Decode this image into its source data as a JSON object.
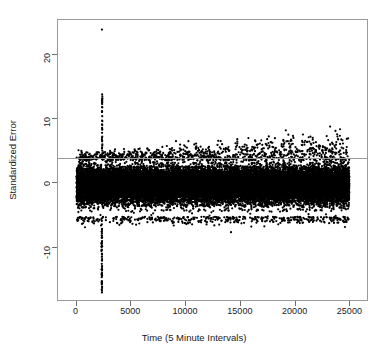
{
  "chart_data": {
    "type": "scatter",
    "title": "",
    "xlabel": "Time (5 Minute Intervals)",
    "ylabel": "Standardized Error",
    "xlim": [
      -1700,
      26700
    ],
    "ylim": [
      -18.5,
      25.5
    ],
    "grid": false,
    "legend": null,
    "point_color": "#000000",
    "point_style": "filled-circle",
    "point_size_px": 2.2,
    "axis_color": "#6e6e6e",
    "box_color": "#9a9a9a",
    "xticks": [
      0,
      5000,
      10000,
      15000,
      20000,
      25000
    ],
    "xtick_labels": [
      "0",
      "5000",
      "10000",
      "15000",
      "20000",
      "25000"
    ],
    "yticks": [
      -10,
      0,
      10,
      20
    ],
    "ytick_labels": [
      "-10",
      "0",
      "10",
      "20"
    ],
    "annotations": [
      {
        "name": "threshold-line",
        "type": "hline",
        "y": 4.0,
        "color": "#9a9a9a",
        "width_px": 1
      }
    ],
    "series": [
      {
        "name": "standardized-error",
        "description": "Dense band of standardized residuals across 5-minute interval time index, with a large transient spike near t=2300.",
        "n_points": 24500,
        "x_start": 0,
        "x_end": 24900,
        "band_center": -0.3,
        "band_sd": 1.35,
        "band_upper_edge": 3.6,
        "band_lower_edge": -5.2,
        "outliers": [
          {
            "x": 2310,
            "y": 24.0
          },
          {
            "x": 2330,
            "y": 13.9
          },
          {
            "x": 2330,
            "y": 12.6
          },
          {
            "x": 2335,
            "y": 11.9
          },
          {
            "x": 2325,
            "y": 11.2
          },
          {
            "x": 2340,
            "y": 10.5
          },
          {
            "x": 2330,
            "y": 9.8
          },
          {
            "x": 2345,
            "y": 9.1
          },
          {
            "x": 2335,
            "y": 8.5
          },
          {
            "x": 2325,
            "y": 7.9
          },
          {
            "x": 2340,
            "y": 7.3
          },
          {
            "x": 2330,
            "y": 6.7
          },
          {
            "x": 2350,
            "y": 6.1
          },
          {
            "x": 2320,
            "y": 5.6
          },
          {
            "x": 2345,
            "y": 5.1
          },
          {
            "x": 2335,
            "y": 4.7
          },
          {
            "x": 2355,
            "y": 4.3
          },
          {
            "x": 2300,
            "y": -6.4
          },
          {
            "x": 2320,
            "y": -7.1
          },
          {
            "x": 2310,
            "y": -7.8
          },
          {
            "x": 2330,
            "y": -8.4
          },
          {
            "x": 2315,
            "y": -9.1
          },
          {
            "x": 2325,
            "y": -9.8
          },
          {
            "x": 2310,
            "y": -11.4
          },
          {
            "x": 2325,
            "y": -12.9
          },
          {
            "x": 2315,
            "y": -13.6
          },
          {
            "x": 2330,
            "y": -14.4
          },
          {
            "x": 2320,
            "y": -15.6
          },
          {
            "x": 2325,
            "y": -16.3
          },
          {
            "x": 2315,
            "y": -17.0
          },
          {
            "x": 3100,
            "y": 4.9
          },
          {
            "x": 3450,
            "y": 4.4
          },
          {
            "x": 4200,
            "y": 4.2
          },
          {
            "x": 5100,
            "y": -6.3
          },
          {
            "x": 9900,
            "y": -6.2
          },
          {
            "x": 12400,
            "y": -6.0
          },
          {
            "x": 14100,
            "y": -7.6
          },
          {
            "x": 15100,
            "y": 5.1
          },
          {
            "x": 16200,
            "y": 4.6
          },
          {
            "x": 16900,
            "y": 5.3
          },
          {
            "x": 17400,
            "y": 6.9
          },
          {
            "x": 17600,
            "y": 5.9
          },
          {
            "x": 18100,
            "y": 5.2
          },
          {
            "x": 18900,
            "y": 5.8
          },
          {
            "x": 19400,
            "y": 6.2
          },
          {
            "x": 20100,
            "y": 5.4
          },
          {
            "x": 20800,
            "y": 6.4
          },
          {
            "x": 21300,
            "y": 5.0
          },
          {
            "x": 22100,
            "y": 5.7
          },
          {
            "x": 22800,
            "y": 5.2
          },
          {
            "x": 23600,
            "y": 4.8
          },
          {
            "x": 24200,
            "y": 5.6
          },
          {
            "x": 24500,
            "y": -6.8
          },
          {
            "x": 23900,
            "y": -6.1
          }
        ]
      }
    ]
  }
}
